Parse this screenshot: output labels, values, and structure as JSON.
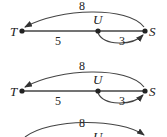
{
  "diagrams": [
    {
      "nodes": {
        "T": "T",
        "U": "U",
        "S": "S"
      },
      "edges": [
        {
          "from": "S",
          "to": "T",
          "weight": "8",
          "style": "curved-above"
        },
        {
          "from": "T",
          "to": "S",
          "weight": "5",
          "style": "straight"
        },
        {
          "from": "U",
          "to": "S",
          "weight": "3",
          "style": "curved-below"
        }
      ]
    },
    {
      "nodes": {
        "T": "T",
        "U": "U",
        "S": "S"
      },
      "edges": [
        {
          "from": "S",
          "to": "T",
          "weight": "8",
          "style": "curved-above"
        },
        {
          "from": "T",
          "to": "S",
          "weight": "5",
          "style": "straight"
        },
        {
          "from": "U",
          "to": "S",
          "weight": "3",
          "style": "curved-below"
        }
      ]
    },
    {
      "nodes": {
        "U": "U"
      },
      "edges": [
        {
          "from": "T",
          "to": "S",
          "weight": "8",
          "style": "curved-above"
        }
      ]
    }
  ]
}
